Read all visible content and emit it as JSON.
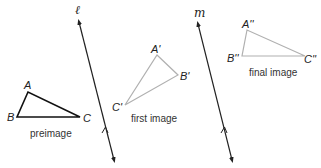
{
  "lines": {
    "l": {
      "label": "ℓ",
      "x1": 79,
      "y1": 20,
      "x2": 114,
      "y2": 160,
      "tick_y": 128,
      "color": "#222222"
    },
    "m": {
      "label": "m",
      "x1": 198,
      "y1": 22,
      "x2": 232,
      "y2": 160,
      "tick_y": 128,
      "color": "#222222"
    }
  },
  "triangles": {
    "preimage": {
      "caption": "preimage",
      "color": "#111111",
      "vertices": {
        "A": [
          28,
          92
        ],
        "B": [
          17,
          117
        ],
        "C": [
          80,
          117
        ]
      },
      "labels": {
        "A": "A",
        "B": "B",
        "C": "C"
      }
    },
    "first_image": {
      "caption": "first image",
      "color": "#b0b0b0",
      "vertices": {
        "A": [
          157,
          55
        ],
        "B": [
          178,
          75
        ],
        "C": [
          125,
          105
        ]
      },
      "labels": {
        "A": "A'",
        "B": "B'",
        "C": "C'"
      }
    },
    "final_image": {
      "caption": "final image",
      "color": "#b0b0b0",
      "vertices": {
        "A": [
          247,
          30
        ],
        "B": [
          242,
          56
        ],
        "C": [
          305,
          56
        ]
      },
      "labels": {
        "A": "A''",
        "B": "B''",
        "C": "C''"
      }
    }
  }
}
